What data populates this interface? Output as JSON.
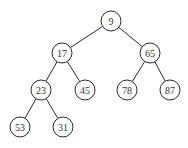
{
  "diagram": {
    "type": "binary-tree",
    "nodes": [
      {
        "id": "n9",
        "label": "9",
        "x": 111,
        "y": 21
      },
      {
        "id": "n17",
        "label": "17",
        "x": 62,
        "y": 53
      },
      {
        "id": "n65",
        "label": "65",
        "x": 150,
        "y": 53
      },
      {
        "id": "n23",
        "label": "23",
        "x": 41,
        "y": 90
      },
      {
        "id": "n45",
        "label": "45",
        "x": 85,
        "y": 90
      },
      {
        "id": "n78",
        "label": "78",
        "x": 127,
        "y": 90
      },
      {
        "id": "n87",
        "label": "87",
        "x": 170,
        "y": 90
      },
      {
        "id": "n53",
        "label": "53",
        "x": 20,
        "y": 127
      },
      {
        "id": "n31",
        "label": "31",
        "x": 63,
        "y": 127
      }
    ],
    "edges": [
      {
        "from": "n9",
        "to": "n17"
      },
      {
        "from": "n9",
        "to": "n65"
      },
      {
        "from": "n17",
        "to": "n23"
      },
      {
        "from": "n17",
        "to": "n45"
      },
      {
        "from": "n65",
        "to": "n78"
      },
      {
        "from": "n65",
        "to": "n87"
      },
      {
        "from": "n23",
        "to": "n53"
      },
      {
        "from": "n23",
        "to": "n31"
      }
    ],
    "node_radius": 10
  }
}
